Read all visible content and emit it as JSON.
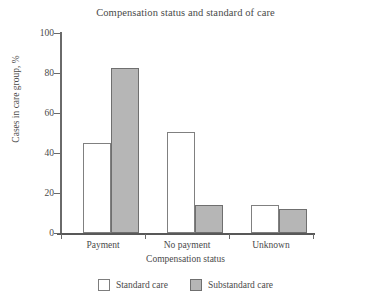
{
  "chart_data": {
    "type": "bar",
    "title": "Compensation status and standard of care",
    "xlabel": "Compensation status",
    "ylabel": "Cases in care group, %",
    "categories": [
      "Payment",
      "No payment",
      "Unknown"
    ],
    "series": [
      {
        "name": "Standard care",
        "color": "#ffffff",
        "values": [
          45,
          50.5,
          14
        ]
      },
      {
        "name": "Substandard care",
        "color": "#b6b6b6",
        "values": [
          82.5,
          14,
          12
        ]
      }
    ],
    "ylim": [
      0,
      100
    ],
    "yticks": [
      0,
      20,
      40,
      60,
      80,
      100
    ],
    "ytick_labels": [
      "0",
      "20",
      "40",
      "60",
      "80",
      "100"
    ],
    "grid": false,
    "legend_position": "bottom"
  }
}
